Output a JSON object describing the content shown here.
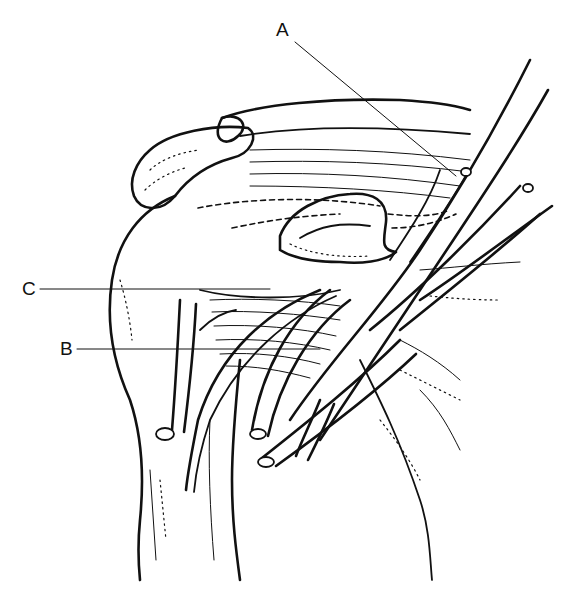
{
  "figure": {
    "labels": [
      {
        "id": "A",
        "text": "A"
      },
      {
        "id": "B",
        "text": "B"
      },
      {
        "id": "C",
        "text": "C"
      }
    ],
    "colors": {
      "ink": "#111111",
      "background": "#ffffff"
    }
  }
}
